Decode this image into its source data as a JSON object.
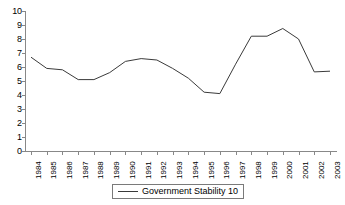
{
  "chart_data": {
    "type": "line",
    "title": "",
    "xlabel": "",
    "ylabel": "",
    "ylim": [
      0,
      10
    ],
    "ytick_step": 1,
    "grid": false,
    "legend_position": "bottom-center",
    "line_color": "#3a3a3a",
    "axis_color": "#888888",
    "background_color": "#ffffff",
    "categories": [
      "1984",
      "1985",
      "1986",
      "1987",
      "1988",
      "1989",
      "1990",
      "1991",
      "1992",
      "1993",
      "1994",
      "1995",
      "1996",
      "1997",
      "1998",
      "1999",
      "2000",
      "2001",
      "2002",
      "2003"
    ],
    "yticks": [
      "0",
      "1",
      "2",
      "3",
      "4",
      "5",
      "6",
      "7",
      "8",
      "9",
      "10"
    ],
    "series": [
      {
        "name": "Government Stability 10",
        "values": [
          6.7,
          5.9,
          5.8,
          5.1,
          5.1,
          5.6,
          6.4,
          6.6,
          6.5,
          5.9,
          5.2,
          4.2,
          4.1,
          6.2,
          8.2,
          8.2,
          8.75,
          8.0,
          5.65,
          5.7
        ]
      }
    ]
  },
  "legend": {
    "entries": [
      {
        "label": "Government Stability 10",
        "swatch": "line-swatch"
      }
    ]
  }
}
